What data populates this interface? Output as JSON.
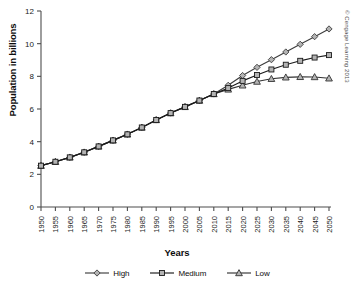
{
  "chart_data": {
    "type": "line",
    "title": "",
    "xlabel": "Years",
    "ylabel": "Population in billions",
    "categories": [
      1950,
      1955,
      1960,
      1965,
      1970,
      1975,
      1980,
      1985,
      1990,
      1995,
      2000,
      2005,
      2010,
      2015,
      2020,
      2025,
      2030,
      2035,
      2040,
      2045,
      2050
    ],
    "xtick_labels": [
      "1950",
      "1955",
      "1960",
      "1965",
      "1970",
      "1975",
      "1980",
      "1985",
      "1990",
      "1995",
      "2000",
      "2005",
      "2010",
      "2015",
      "2020",
      "2025",
      "2030",
      "2035",
      "2040",
      "2045",
      "2050"
    ],
    "ytick_labels": [
      "0",
      "2",
      "4",
      "6",
      "8",
      "10",
      "12"
    ],
    "ytick_values": [
      0,
      2,
      4,
      6,
      8,
      10,
      12
    ],
    "xlim": [
      1950,
      2050
    ],
    "ylim": [
      0,
      12
    ],
    "grid": false,
    "legend_position": "bottom",
    "series": [
      {
        "name": "High",
        "marker": "diamond",
        "color": "#3d3d3d",
        "values": [
          2.53,
          2.77,
          3.04,
          3.35,
          3.71,
          4.08,
          4.45,
          4.87,
          5.33,
          5.75,
          6.13,
          6.52,
          6.92,
          7.45,
          8.05,
          8.55,
          9.02,
          9.49,
          9.96,
          10.43,
          10.9
        ]
      },
      {
        "name": "Medium",
        "marker": "square",
        "color": "#1a1a1a",
        "values": [
          2.53,
          2.77,
          3.04,
          3.35,
          3.71,
          4.08,
          4.45,
          4.87,
          5.33,
          5.75,
          6.13,
          6.52,
          6.92,
          7.28,
          7.72,
          8.08,
          8.42,
          8.71,
          8.95,
          9.15,
          9.3
        ]
      },
      {
        "name": "Low",
        "marker": "triangle",
        "color": "#333333",
        "values": [
          2.53,
          2.77,
          3.04,
          3.35,
          3.71,
          4.08,
          4.45,
          4.87,
          5.33,
          5.75,
          6.13,
          6.52,
          6.92,
          7.2,
          7.45,
          7.68,
          7.85,
          7.94,
          7.97,
          7.96,
          7.88
        ]
      }
    ]
  },
  "legend": {
    "items": [
      {
        "label": "High",
        "marker": "diamond"
      },
      {
        "label": "Medium",
        "marker": "square"
      },
      {
        "label": "Low",
        "marker": "triangle"
      }
    ]
  },
  "credit": {
    "text": "© Cengage Learning 2013"
  },
  "colors": {
    "axis": "#4d4d4d",
    "high": "#3d3d3d",
    "medium": "#1a1a1a",
    "low": "#333333",
    "marker_fill": "#b3b3b3",
    "text": "#1a1a1a",
    "background": "#ffffff"
  }
}
